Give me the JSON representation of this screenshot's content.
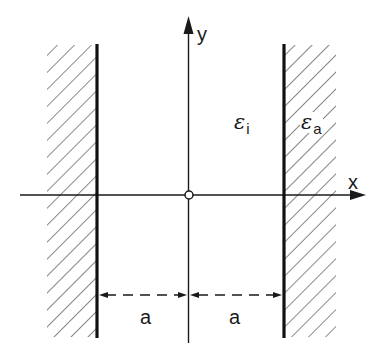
{
  "diagram": {
    "type": "dielectric slab between two half-spaces (cross-section)",
    "axes": {
      "x_label": "x",
      "y_label": "y",
      "origin_marker": "open-circle"
    },
    "regions": [
      {
        "name": "inner",
        "symbol": "ε",
        "subscript": "i"
      },
      {
        "name": "outer",
        "symbol": "ε",
        "subscript": "a"
      }
    ],
    "walls": [
      "left",
      "right"
    ],
    "dimensions": [
      {
        "label": "a",
        "from": "left-wall",
        "to": "y-axis"
      },
      {
        "label": "a",
        "from": "y-axis",
        "to": "right-wall"
      }
    ],
    "colors": {
      "line": "#1a1a1a",
      "hatch": "#4a4a4a",
      "background": "#ffffff"
    }
  }
}
